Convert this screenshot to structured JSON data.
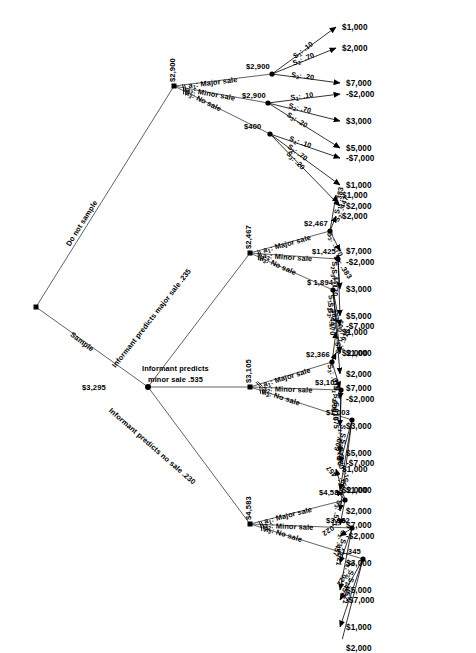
{
  "diagram": {
    "type": "decision-tree",
    "root": {
      "emv": "$3,295"
    },
    "root_branches": [
      {
        "label": "Do not sample",
        "pruned": false
      },
      {
        "label": "Sample",
        "pruned": false
      }
    ],
    "informant_branches": [
      {
        "label": "Informant predicts major sale .235",
        "prob": ".235"
      },
      {
        "label": "Informant predicts",
        "label2": "minor sale .535",
        "prob": ".535"
      },
      {
        "label": "Informant predicts no sale .230",
        "prob": ".230"
      }
    ],
    "actions": {
      "a1": "a1:  Major sale",
      "a2": "a2:  Minor sale",
      "a3": "a3:  No sale"
    },
    "action_labels": [
      {
        "id": "a1",
        "sub": "1",
        "text": "Major sale"
      },
      {
        "id": "a2",
        "sub": "2",
        "text": "Minor sale"
      },
      {
        "id": "a3",
        "sub": "3",
        "text": "No sale"
      }
    ],
    "states": [
      {
        "id": "S1",
        "sub": "1"
      },
      {
        "id": "S2",
        "sub": "2"
      },
      {
        "id": "S3",
        "sub": "3"
      }
    ],
    "payoff_sequence": [
      "$1,000",
      "$2,000",
      "$7,000",
      "-$2,000",
      "$3,000",
      "$5,000",
      "-$7,000",
      "$1,000",
      "$2,000"
    ],
    "blocks": [
      {
        "name": "do-not-sample",
        "decision_emv": "$2,900",
        "chosen": "a1",
        "branches": [
          {
            "action": "a1",
            "emv": "$2,900",
            "pruned": false,
            "probs": [
              ".10",
              ".70",
              ".20"
            ],
            "payoffs": [
              "$1,000",
              "$2,000",
              "$7,000"
            ]
          },
          {
            "action": "a2",
            "emv": "$2,900",
            "pruned": true,
            "probs": [
              ".10",
              ".70",
              ".20"
            ],
            "payoffs": [
              "-$2,000",
              "$3,000",
              "$5,000"
            ]
          },
          {
            "action": "a3",
            "emv": "$400",
            "pruned": true,
            "probs": [
              ".10",
              ".70",
              ".20"
            ],
            "payoffs": [
              "-$7,000",
              "$1,000",
              "$2,000"
            ]
          }
        ]
      },
      {
        "name": "predicts-major-sale",
        "decision_emv": "$2,467",
        "chosen": "a1",
        "branches": [
          {
            "action": "a1",
            "emv": "$2,467",
            "pruned": false,
            "probs": [
              ".383",
              ".447",
              ".170"
            ],
            "payoffs": [
              "$1,000",
              "$2,000",
              "$7,000"
            ]
          },
          {
            "action": "a2",
            "emv": "$1,425",
            "pruned": true,
            "probs": [
              ".383",
              ".447",
              ".170"
            ],
            "payoffs": [
              "-$2,000",
              "$3,000",
              "$5,000"
            ]
          },
          {
            "action": "a3",
            "emv": "$ 1,894",
            "pruned": true,
            "probs": [
              ".383",
              ".447",
              ".170"
            ],
            "payoffs": [
              "-$7,000",
              "$1,000",
              "$2,000"
            ]
          }
        ]
      },
      {
        "name": "predicts-minor-sale",
        "decision_emv": "$3,105",
        "chosen": "a2",
        "branches": [
          {
            "action": "a1",
            "emv": "$2,366",
            "pruned": true,
            "probs": [
              ".009",
              ".916",
              ".075"
            ],
            "payoffs": [
              "$1,000",
              "$2,000",
              "$7,000"
            ]
          },
          {
            "action": "a2",
            "emv": "$3,105",
            "pruned": false,
            "probs": [
              ".009",
              ".916",
              ".075"
            ],
            "payoffs": [
              "-$2,000",
              "$3,000",
              "$5,000"
            ]
          },
          {
            "action": "a3",
            "emv": "$1,003",
            "pruned": true,
            "probs": [
              ".009",
              ".916",
              ".075"
            ],
            "payoffs": [
              "-$7,000",
              "$1,000",
              "$2,000"
            ]
          }
        ]
      },
      {
        "name": "predicts-no-sale",
        "decision_emv": "$4,583",
        "chosen": "a1",
        "branches": [
          {
            "action": "a1",
            "emv": "$4,583",
            "pruned": false,
            "probs": [
              ".022",
              ".457",
              ".521"
            ],
            "payoffs": [
              "$1,000",
              "$2,000",
              "$7,000"
            ]
          },
          {
            "action": "a2",
            "emv": "$3,932",
            "pruned": true,
            "probs": [
              ".022",
              ".457",
              ".521"
            ],
            "payoffs": [
              "-$2,000",
              "$3,000",
              "$5,000"
            ]
          },
          {
            "action": "a3",
            "emv": "$1,345",
            "pruned": true,
            "probs": [
              ".022",
              ".457",
              ".521"
            ],
            "payoffs": [
              "-$7,000",
              "$1,000",
              "$2,000"
            ]
          }
        ]
      }
    ],
    "colors": {
      "line": "#3a3a3a",
      "node": "#000000",
      "text": "#000000"
    }
  }
}
